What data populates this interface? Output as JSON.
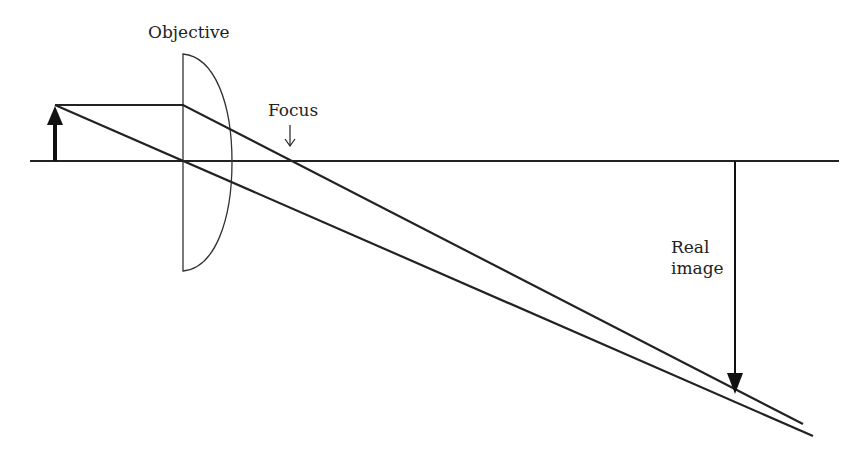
{
  "diagram": {
    "labels": {
      "objective": "Objective",
      "focus": "Focus",
      "real_image_line1": "Real",
      "real_image_line2": "image"
    },
    "colors": {
      "line": "#222222",
      "background": "#ffffff"
    },
    "elements": {
      "optical_axis": {
        "x1": 30,
        "y1": 161,
        "x2": 839,
        "y2": 161
      },
      "object_arrow": {
        "x": 55,
        "base_y": 161,
        "tip_y": 105
      },
      "lens": {
        "flat_x": 183,
        "top_y": 54,
        "bottom_y": 271,
        "bulge_x": 232
      },
      "focus_point": {
        "x": 286,
        "y": 161
      },
      "image_arrow": {
        "x": 735,
        "base_y": 161,
        "tip_y": 394
      },
      "rays": [
        {
          "name": "parallel-ray",
          "points": [
            [
              55,
              105
            ],
            [
              183,
              105
            ],
            [
              803,
              424
            ]
          ]
        },
        {
          "name": "chief-ray",
          "points": [
            [
              55,
              105
            ],
            [
              813,
              436
            ]
          ]
        }
      ]
    }
  }
}
